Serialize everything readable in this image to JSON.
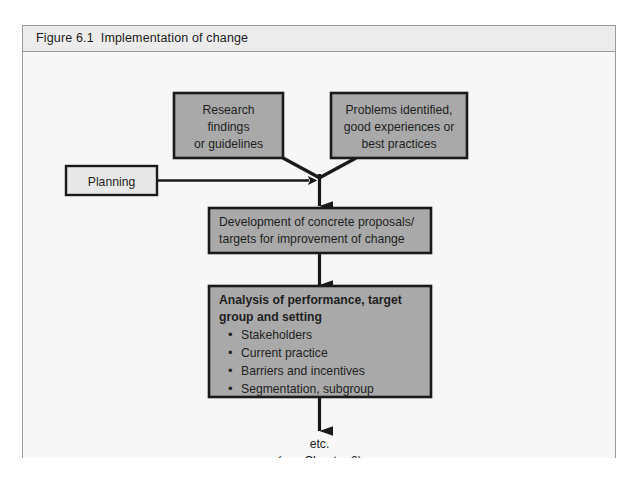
{
  "figure": {
    "caption_number": "Figure 6.1",
    "caption_title": "Implementation of change"
  },
  "colors": {
    "box_fill": "#a9a9a9",
    "box_border": "#1a1a1a",
    "planning_fill": "#e8e8e8",
    "panel_bg": "#f7f7f7",
    "header_bg": "#ececec",
    "frame_border": "#9b9b9b",
    "arrow": "#1a1a1a",
    "text": "#1f1f1f"
  },
  "diagram": {
    "type": "flowchart",
    "nodes": {
      "research": {
        "id": "research",
        "style": "gray",
        "align": "center",
        "lines": [
          "Research",
          "findings",
          "or guidelines"
        ]
      },
      "problems": {
        "id": "problems",
        "style": "gray",
        "align": "center",
        "lines": [
          "Problems identified,",
          "good experiences or",
          "best practices"
        ]
      },
      "planning": {
        "id": "planning",
        "style": "light",
        "align": "center",
        "lines": [
          "Planning"
        ]
      },
      "development": {
        "id": "development",
        "style": "gray",
        "align": "left",
        "lines": [
          "Development of concrete proposals/",
          "targets for improvement of change"
        ]
      },
      "analysis": {
        "id": "analysis",
        "style": "gray",
        "align": "left",
        "heading": [
          "Analysis of performance, target",
          "group and setting"
        ],
        "bullets": [
          "Stakeholders",
          "Current practice",
          "Barriers and incentives",
          "Segmentation, subgroup"
        ]
      }
    },
    "end_note": {
      "lines": [
        "etc.",
        "(see Chapter 3)"
      ]
    },
    "edges": [
      {
        "from": "research",
        "to": "development",
        "kind": "merge-diagonal"
      },
      {
        "from": "problems",
        "to": "development",
        "kind": "merge-diagonal"
      },
      {
        "from": "planning",
        "to": "merge-point",
        "kind": "horizontal-arrow"
      },
      {
        "from": "merge-point",
        "to": "development",
        "kind": "vertical-arrow"
      },
      {
        "from": "development",
        "to": "analysis",
        "kind": "vertical-arrow"
      },
      {
        "from": "analysis",
        "to": "end_note",
        "kind": "vertical-arrow"
      }
    ]
  }
}
